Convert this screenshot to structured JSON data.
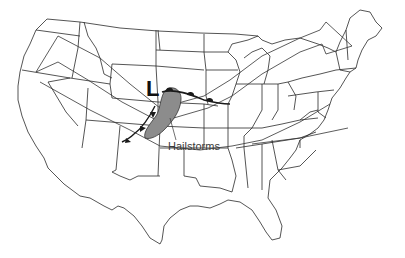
{
  "map": {
    "type": "weather map",
    "region": "Contiguous United States",
    "colors": {
      "background": "#ffffff",
      "state_lines": "#2a2a2a",
      "hail_region_fill": "#8c8c8c",
      "front_line": "#1a1a1a"
    },
    "symbols": {
      "low_pressure": "L"
    },
    "labels": {
      "hail_region": "Hailstorms"
    },
    "features": [
      {
        "kind": "low-pressure-center",
        "label": "L"
      },
      {
        "kind": "warm-front"
      },
      {
        "kind": "cold-front"
      },
      {
        "kind": "shaded-region",
        "label": "Hailstorms"
      },
      {
        "kind": "jet-stream-arrow"
      },
      {
        "kind": "jet-stream-arrow"
      }
    ]
  }
}
